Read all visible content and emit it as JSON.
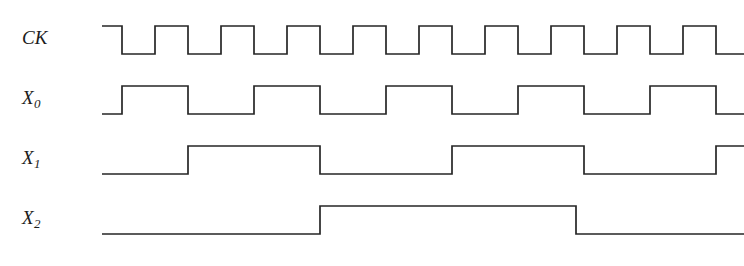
{
  "figure": {
    "title_fragment": "",
    "width": 744,
    "height": 266,
    "background": "#ffffff",
    "stroke_color": "#262626",
    "stroke_width": 1.7
  },
  "labels": {
    "ck": "CK",
    "x0_base": "X",
    "x0_sub": "0",
    "x1_base": "X",
    "x1_sub": "1",
    "x2_base": "X",
    "x2_sub": "2"
  },
  "chart_data": {
    "type": "line",
    "title": "",
    "xlabel": "",
    "ylabel": "",
    "subtype": "digital-timing-diagram",
    "grid": false,
    "legend": "none",
    "x_axis_units": "clock periods",
    "clock_period_px": 66,
    "x_start_px": 102,
    "x_end_px": 744,
    "rows": [
      {
        "name": "CK",
        "label_key": "ck",
        "label_x": 22,
        "label_y": 33,
        "y_high": 26,
        "y_low": 54,
        "period_px": 66,
        "initial_level": "high",
        "first_edge_px": 122,
        "end_level": "low",
        "transitions_px": [
          122,
          155,
          188,
          221,
          254,
          287,
          320,
          353,
          386,
          419,
          452,
          485,
          518,
          551,
          584,
          617,
          650,
          683,
          716
        ],
        "toggles_on": "free-running clock"
      },
      {
        "name": "X0",
        "label_key": "x0",
        "label_x": 22,
        "label_y": 93,
        "y_high": 86,
        "y_low": 114,
        "period_px": 132,
        "initial_level": "low",
        "first_edge_px": 122,
        "end_level": "low",
        "transitions_px": [
          122,
          188,
          254,
          320,
          386,
          452,
          518,
          584,
          650,
          716
        ],
        "toggles_on": "CK falling edge"
      },
      {
        "name": "X1",
        "label_key": "x1",
        "label_x": 22,
        "label_y": 153,
        "y_high": 146,
        "y_low": 174,
        "period_px": 264,
        "initial_level": "low",
        "first_edge_px": 188,
        "end_level": "high",
        "transitions_px": [
          188,
          320,
          452,
          584,
          716
        ],
        "toggles_on": "X0 falling edge"
      },
      {
        "name": "X2",
        "label_key": "x2",
        "label_x": 22,
        "label_y": 213,
        "y_high": 206,
        "y_low": 234,
        "period_px": 528,
        "initial_level": "low",
        "first_edge_px": 320,
        "end_level": "low",
        "transitions_px": [
          320,
          576
        ],
        "toggles_on": "X1 falling edge"
      }
    ],
    "count_sequence": [
      0,
      1,
      2,
      3,
      4,
      5,
      6,
      7,
      0,
      1
    ],
    "note": "X2 X1 X0 form a 3-bit binary ripple counter value advancing on each CK falling edge."
  }
}
